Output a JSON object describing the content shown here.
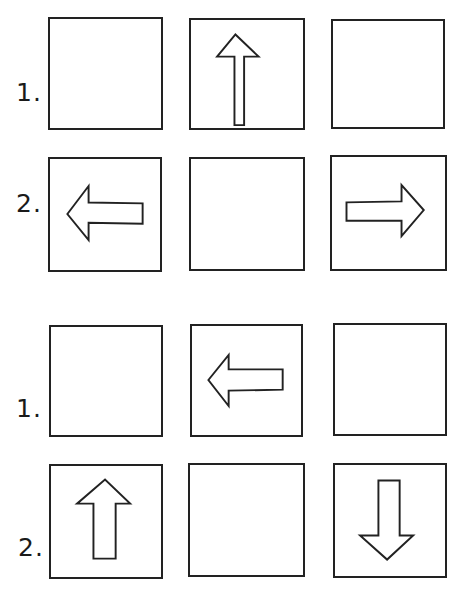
{
  "figure": {
    "sections": [
      {
        "id": "set-a",
        "rows": [
          {
            "label": "1.",
            "cells": [
              "empty",
              "arrow-up",
              "empty"
            ]
          },
          {
            "label": "2.",
            "cells": [
              "arrow-left",
              "empty",
              "arrow-right"
            ]
          }
        ]
      },
      {
        "id": "set-b",
        "rows": [
          {
            "label": "1.",
            "cells": [
              "empty",
              "arrow-left",
              "empty"
            ]
          },
          {
            "label": "2.",
            "cells": [
              "arrow-up",
              "empty",
              "arrow-down"
            ]
          }
        ]
      }
    ],
    "colors": {
      "line": "#222222",
      "background": "#ffffff"
    }
  }
}
